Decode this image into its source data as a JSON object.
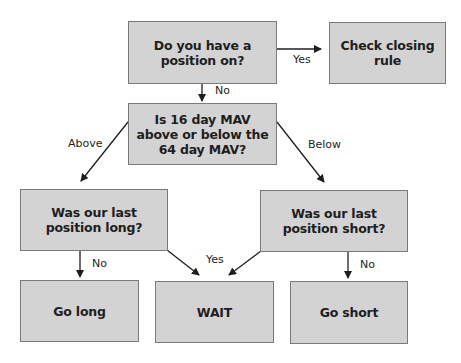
{
  "diagram": {
    "type": "flowchart",
    "nodes": [
      {
        "id": "q_position",
        "text": "Do you have a position on?",
        "lines": [
          "Do you have a",
          "position on?"
        ]
      },
      {
        "id": "check_closing",
        "text": "Check closing rule",
        "lines": [
          "Check closing rule"
        ]
      },
      {
        "id": "q_mav",
        "text": "Is 16 day MAV above or below the 64 day MAV?",
        "lines": [
          "Is 16 day MAV",
          "above or below the",
          "64 day MAV?"
        ]
      },
      {
        "id": "q_last_long",
        "text": "Was our last position long?",
        "lines": [
          "Was our last",
          "position long?"
        ]
      },
      {
        "id": "q_last_short",
        "text": "Was our last position short?",
        "lines": [
          "Was our last",
          "position short?"
        ]
      },
      {
        "id": "go_long",
        "text": "Go long",
        "lines": [
          "Go long"
        ]
      },
      {
        "id": "wait",
        "text": "WAIT",
        "lines": [
          "WAIT"
        ]
      },
      {
        "id": "go_short",
        "text": "Go short",
        "lines": [
          "Go short"
        ]
      }
    ],
    "edges": [
      {
        "from": "q_position",
        "to": "check_closing",
        "label": "Yes"
      },
      {
        "from": "q_position",
        "to": "q_mav",
        "label": "No"
      },
      {
        "from": "q_mav",
        "to": "q_last_long",
        "label": "Above"
      },
      {
        "from": "q_mav",
        "to": "q_last_short",
        "label": "Below"
      },
      {
        "from": "q_last_long",
        "to": "go_long",
        "label": "No"
      },
      {
        "from": "q_last_long",
        "to": "wait",
        "label": "Yes"
      },
      {
        "from": "q_last_short",
        "to": "wait",
        "label": ""
      },
      {
        "from": "q_last_short",
        "to": "go_short",
        "label": "No"
      }
    ]
  },
  "labels": {
    "yes_top": "Yes",
    "no_top": "No",
    "above": "Above",
    "below": "Below",
    "no_left": "No",
    "yes_mid": "Yes",
    "no_right": "No"
  },
  "colors": {
    "box_fill": "#d3d3d3",
    "box_border": "#7a7a7a",
    "arrow": "#1e1e1e"
  }
}
